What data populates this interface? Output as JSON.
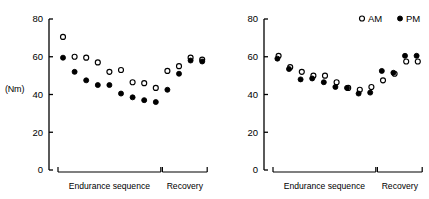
{
  "figure": {
    "axis_unit_label": "(Nm)",
    "legend": {
      "am_label": "AM",
      "pm_label": "PM",
      "am_marker": "open-circle-icon",
      "pm_marker": "filled-circle-icon"
    },
    "bracket_labels": {
      "endurance": "Endurance sequence",
      "recovery": "Recovery"
    },
    "colors": {
      "axis": "#000000",
      "marker": "#000000",
      "background": "#ffffff"
    }
  },
  "chart_data": [
    {
      "type": "scatter",
      "panel": "left",
      "title": "",
      "xlabel": "",
      "ylabel": "(Nm)",
      "ylim": [
        0,
        80
      ],
      "yticks": [
        0,
        20,
        40,
        60,
        80
      ],
      "ytick_labels": [
        "0",
        "20",
        "40",
        "60",
        "80"
      ],
      "grid": false,
      "legend_position": "none",
      "x": [
        1,
        2,
        3,
        4,
        5,
        6,
        7,
        8,
        9,
        10,
        11,
        12,
        13
      ],
      "series": [
        {
          "name": "AM",
          "marker": "open-circle",
          "values": [
            70.5,
            60.0,
            59.5,
            57.0,
            52.0,
            53.0,
            46.5,
            46.0,
            43.5,
            52.5,
            55.0,
            59.5,
            58.5
          ]
        },
        {
          "name": "PM",
          "marker": "filled-circle",
          "values": [
            59.5,
            52.0,
            47.5,
            45.0,
            45.0,
            40.5,
            38.5,
            37.0,
            36.0,
            42.5,
            51.0,
            58.0,
            57.5
          ]
        }
      ],
      "segments": [
        {
          "label": "Endurance sequence",
          "from_index": 1,
          "to_index": 9
        },
        {
          "label": "Recovery",
          "from_index": 10,
          "to_index": 13
        }
      ]
    },
    {
      "type": "scatter",
      "panel": "right",
      "title": "",
      "xlabel": "",
      "ylabel": "",
      "ylim": [
        0,
        80
      ],
      "yticks": [
        0,
        20,
        40,
        60,
        80
      ],
      "ytick_labels": [
        "0",
        "20",
        "40",
        "60",
        "80"
      ],
      "grid": false,
      "legend_position": "top-right",
      "x": [
        1,
        2,
        3,
        4,
        5,
        6,
        7,
        8,
        9,
        10,
        11,
        12,
        13
      ],
      "series": [
        {
          "name": "AM",
          "marker": "open-circle",
          "values": [
            60.5,
            54.5,
            52.0,
            50.0,
            50.0,
            46.5,
            43.5,
            42.5,
            44.0,
            47.5,
            51.0,
            57.5,
            57.5
          ]
        },
        {
          "name": "PM",
          "marker": "filled-circle",
          "values": [
            59.0,
            53.5,
            48.0,
            48.5,
            46.5,
            44.0,
            43.5,
            40.5,
            41.0,
            52.5,
            51.5,
            60.5,
            60.5
          ]
        }
      ],
      "segments": [
        {
          "label": "Endurance sequence",
          "from_index": 1,
          "to_index": 9
        },
        {
          "label": "Recovery",
          "from_index": 10,
          "to_index": 13
        }
      ]
    }
  ]
}
